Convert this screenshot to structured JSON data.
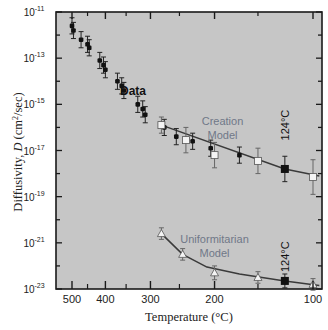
{
  "chart_data": {
    "type": "scatter",
    "title": "",
    "xlabel": "Temperature (°C)",
    "ylabel": "Diffusivity, D (cm²/sec)",
    "x_scale": "reciprocal-kelvin (Arrhenius), decreasing temperature to the right",
    "y_scale": "log10",
    "ylim_log10": [
      -23,
      -11
    ],
    "xlim_celsius": [
      520,
      95
    ],
    "x_ticks": [
      500,
      400,
      300,
      200,
      100
    ],
    "x_minor_ticks": [
      450,
      350,
      250,
      150
    ],
    "y_ticks_log10": [
      -11,
      -13,
      -15,
      -17,
      -19,
      -21,
      -23
    ],
    "y_tick_labels": [
      "10-11",
      "10-13",
      "10-15",
      "10-17",
      "10-19",
      "10-21",
      "10-23"
    ],
    "grid": false,
    "background": "#c8c8c8",
    "annotations": [
      {
        "text": "Data",
        "t": 335,
        "logD": -14.6
      },
      {
        "text": "Creation",
        "t": 190,
        "logD": -15.9
      },
      {
        "text": "Model",
        "t": 190,
        "logD": -16.5
      },
      {
        "text": "124°C",
        "t": 124,
        "logD": -15.9,
        "rotated": true
      },
      {
        "text": "Uniformitarian",
        "t": 200,
        "logD": -21.0
      },
      {
        "text": "Model",
        "t": 200,
        "logD": -21.6
      },
      {
        "text": "124°C",
        "t": 124,
        "logD": -21.6,
        "rotated": true
      }
    ],
    "series": [
      {
        "name": "Data",
        "marker": "filled-circle",
        "color": "#111111",
        "points": [
          {
            "t": 500,
            "logD": -11.6,
            "err": 0.35
          },
          {
            "t": 495,
            "logD": -11.8,
            "err": 0.35
          },
          {
            "t": 470,
            "logD": -12.2,
            "err": 0.35
          },
          {
            "t": 450,
            "logD": -12.4,
            "err": 0.35
          },
          {
            "t": 445,
            "logD": -12.55,
            "err": 0.35
          },
          {
            "t": 415,
            "logD": -13.1,
            "err": 0.35
          },
          {
            "t": 405,
            "logD": -13.3,
            "err": 0.35
          },
          {
            "t": 400,
            "logD": -13.5,
            "err": 0.35
          },
          {
            "t": 370,
            "logD": -14.0,
            "err": 0.35
          },
          {
            "t": 360,
            "logD": -14.2,
            "err": 0.35
          },
          {
            "t": 355,
            "logD": -14.4,
            "err": 0.35
          },
          {
            "t": 325,
            "logD": -15.0,
            "err": 0.35
          },
          {
            "t": 315,
            "logD": -15.2,
            "err": 0.35
          },
          {
            "t": 310,
            "logD": -15.45,
            "err": 0.35
          },
          {
            "t": 275,
            "logD": -16.0,
            "err": 0.35
          },
          {
            "t": 255,
            "logD": -16.4,
            "err": 0.35
          },
          {
            "t": 230,
            "logD": -16.6,
            "err": 0.35
          },
          {
            "t": 205,
            "logD": -16.9,
            "err": 0.35
          },
          {
            "t": 170,
            "logD": -17.2,
            "err": 0.35
          },
          {
            "t": 124,
            "logD": -17.8,
            "err": 0.55,
            "highlight": true
          }
        ]
      },
      {
        "name": "Creation Model",
        "marker": "open-square",
        "color": "#ffffff",
        "line": true,
        "points": [
          {
            "t": 280,
            "logD": -15.9,
            "err": 0.35
          },
          {
            "t": 240,
            "logD": -16.55,
            "err": 0.55
          },
          {
            "t": 200,
            "logD": -17.2,
            "err": 0.55
          },
          {
            "t": 150,
            "logD": -17.45,
            "err": 0.55
          },
          {
            "t": 100,
            "logD": -18.15,
            "err": 0.75
          }
        ],
        "fit_line": [
          {
            "t": 280,
            "logD": -15.9
          },
          {
            "t": 124,
            "logD": -17.8
          },
          {
            "t": 95,
            "logD": -18.1
          }
        ]
      },
      {
        "name": "Uniformitarian Model",
        "marker": "open-triangle",
        "color": "#ffffff",
        "line": true,
        "points": [
          {
            "t": 280,
            "logD": -20.6,
            "err": 0.25
          },
          {
            "t": 245,
            "logD": -21.5,
            "err": 0.25
          },
          {
            "t": 200,
            "logD": -22.3,
            "err": 0.3
          },
          {
            "t": 150,
            "logD": -22.5,
            "err": 0.25
          },
          {
            "t": 100,
            "logD": -22.8,
            "err": 0.25
          }
        ],
        "highlight_point": {
          "t": 124,
          "logD": -22.65,
          "err": 0.3
        },
        "fit_line": [
          {
            "t": 280,
            "logD": -20.6
          },
          {
            "t": 245,
            "logD": -21.5
          },
          {
            "t": 210,
            "logD": -22.05
          },
          {
            "t": 170,
            "logD": -22.35
          },
          {
            "t": 124,
            "logD": -22.65
          },
          {
            "t": 95,
            "logD": -22.85
          }
        ]
      }
    ]
  },
  "axes": {
    "x_title": "Temperature (°C)",
    "y_title": "Diffusivity, D (cm²/sec)"
  },
  "colors": {
    "plot_bg": "#c6c6c6",
    "frame": "#1a1a1a",
    "data_marker": "#111111",
    "model_label": "#707888",
    "fit_line": "#3a3a3a",
    "open_marker_fill": "#f4f4f4"
  }
}
